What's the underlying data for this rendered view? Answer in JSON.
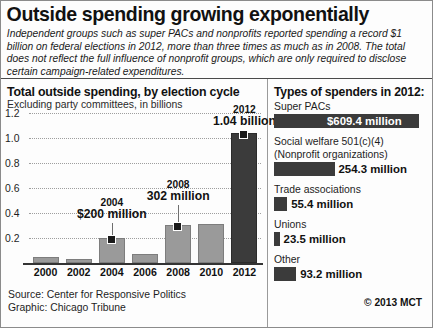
{
  "header": {
    "title": "Outside spending growing exponentially",
    "deck": "Independent groups such as super PACs and nonprofits reported spending a record $1 billion on federal elections in 2012, more than three times as much as in 2008. The total does not reflect the full influence of nonprofit groups, which are only required to disclose certain campaign-related expenditures."
  },
  "chart_data": {
    "type": "bar",
    "title": "Total outside spending, by election cycle",
    "subtitle": "Excluding party committees, in billions",
    "xlabel": "",
    "ylabel": "",
    "ylim": [
      0,
      1.2
    ],
    "yticks": [
      "0.2",
      "0.4",
      "0.6",
      "0.8",
      "1.0",
      "1.2"
    ],
    "grid": true,
    "categories": [
      "2000",
      "2002",
      "2004",
      "2006",
      "2008",
      "2010",
      "2012"
    ],
    "values": [
      0.052,
      0.031,
      0.2,
      0.069,
      0.302,
      0.311,
      1.04
    ],
    "annotations": [
      {
        "category": "2004",
        "year": "2004",
        "value_label": "$200 million"
      },
      {
        "category": "2008",
        "year": "2008",
        "value_label": "302 million"
      },
      {
        "category": "2012",
        "year": "2012",
        "value_label": "1.04 billion"
      }
    ]
  },
  "spenders": {
    "title": "Types of spenders in 2012:",
    "items": [
      {
        "name": "Super PACs",
        "value_label": "$609.4 million",
        "value": 609.4
      },
      {
        "name": "Social welfare 501(c)(4)",
        "name2": "(Nonprofit organizations)",
        "value_label": "254.3 million",
        "value": 254.3
      },
      {
        "name": "Trade associations",
        "value_label": "55.4 million",
        "value": 55.4
      },
      {
        "name": "Unions",
        "value_label": "23.5 million",
        "value": 23.5
      },
      {
        "name": "Other",
        "value_label": "93.2 million",
        "value": 93.2
      }
    ]
  },
  "footer": {
    "source": "Source: Center for Responsive Politics",
    "graphic": "Graphic: Chicago Tribune",
    "credit": "© 2013 MCT"
  }
}
